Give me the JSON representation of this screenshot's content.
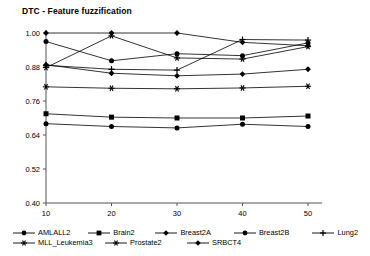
{
  "chart_data": {
    "type": "line",
    "title": "DTC - Feature fuzzification",
    "xlabel": "",
    "ylabel": "",
    "x": [
      10,
      20,
      30,
      40,
      50
    ],
    "xticklabels": [
      "10",
      "20",
      "30",
      "40",
      "50"
    ],
    "yticklabels": [
      "0.40",
      "0.52",
      "0.64",
      "0.76",
      "0.88",
      "1.00"
    ],
    "yticks": [
      0.4,
      0.52,
      0.64,
      0.76,
      0.88,
      1.0
    ],
    "ylim": [
      0.4,
      1.0
    ],
    "xlim": [
      6,
      54
    ],
    "grid": false,
    "legend_position": "bottom",
    "line_color": "#000000",
    "series": [
      {
        "name": "AMLALL2",
        "marker": "circle-filled",
        "values": [
          0.97,
          0.902,
          0.927,
          0.92,
          0.965
        ]
      },
      {
        "name": "Brain2",
        "marker": "square-filled",
        "values": [
          0.715,
          0.703,
          0.7,
          0.7,
          0.707
        ]
      },
      {
        "name": "Breast2A",
        "marker": "diamond-filled",
        "values": [
          0.888,
          0.858,
          0.849,
          0.855,
          0.872
        ]
      },
      {
        "name": "Breast2B",
        "marker": "circle-filled",
        "values": [
          0.68,
          0.67,
          0.665,
          0.678,
          0.67
        ]
      },
      {
        "name": "Lung2",
        "marker": "plus",
        "values": [
          0.886,
          0.872,
          0.869,
          0.977,
          0.975
        ]
      },
      {
        "name": "MLL_Leukemia3",
        "marker": "star",
        "values": [
          0.81,
          0.805,
          0.803,
          0.806,
          0.812
        ]
      },
      {
        "name": "Prostate2",
        "marker": "asterisk",
        "values": [
          0.878,
          0.99,
          0.912,
          0.908,
          0.952
        ]
      },
      {
        "name": "SRBCT4",
        "marker": "diamond-filled",
        "values": [
          1.0,
          1.0,
          1.0,
          0.967,
          0.955
        ]
      }
    ]
  },
  "legend": {
    "row1": [
      {
        "label": "AMLALL2",
        "marker": "circle-filled"
      },
      {
        "label": "Brain2",
        "marker": "square-filled"
      },
      {
        "label": "Breast2A",
        "marker": "diamond-filled"
      },
      {
        "label": "Breast2B",
        "marker": "circle-filled"
      },
      {
        "label": "Lung2",
        "marker": "plus"
      }
    ],
    "row2": [
      {
        "label": "MLL_Leukemia3",
        "marker": "star"
      },
      {
        "label": "Prostate2",
        "marker": "asterisk"
      },
      {
        "label": "SRBCT4",
        "marker": "diamond-filled"
      }
    ]
  }
}
